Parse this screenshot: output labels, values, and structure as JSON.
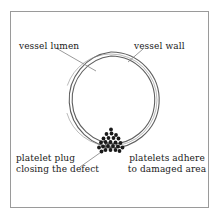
{
  "figure": {
    "type": "medical-illustration",
    "background_color": "#ffffff",
    "frame": {
      "border_color": "#9a9a9a",
      "x": 10,
      "y": 11,
      "width": 199,
      "height": 197
    },
    "vessel": {
      "shape": "circle",
      "center_x": 111,
      "center_y": 100,
      "outer_radius": 48,
      "inner_radius": 44,
      "wall_color": "#6e6e6e",
      "wall_fill": "#ffffff",
      "gap_description": "defect opening at bottom of vessel wall",
      "gap_start_degrees": 83,
      "gap_end_degrees": 97
    },
    "platelets": {
      "count": 24,
      "color": "#1a1a1a",
      "radius": 1.9,
      "cluster_center_x": 111,
      "cluster_center_y": 143,
      "points": [
        [
          106.5,
          134.0
        ],
        [
          111.5,
          133.5
        ],
        [
          116.0,
          135.0
        ],
        [
          103.5,
          138.5
        ],
        [
          108.5,
          138.0
        ],
        [
          113.5,
          138.0
        ],
        [
          118.5,
          138.5
        ],
        [
          101.0,
          142.5
        ],
        [
          105.5,
          142.0
        ],
        [
          110.5,
          142.0
        ],
        [
          115.5,
          142.5
        ],
        [
          120.5,
          143.0
        ],
        [
          103.0,
          146.5
        ],
        [
          108.0,
          146.0
        ],
        [
          113.0,
          146.0
        ],
        [
          118.0,
          146.5
        ],
        [
          99.0,
          147.5
        ],
        [
          122.5,
          147.5
        ],
        [
          105.5,
          150.0
        ],
        [
          110.5,
          150.0
        ],
        [
          115.5,
          150.0
        ],
        [
          101.5,
          151.5
        ],
        [
          119.5,
          151.0
        ],
        [
          111.0,
          129.5
        ]
      ]
    },
    "leader_lines": [
      {
        "name": "vessel-lumen-leader",
        "color": "#777777",
        "x1": 56,
        "y1": 48,
        "x2": 96,
        "y2": 71
      },
      {
        "name": "vessel-wall-leader",
        "color": "#777777",
        "x1": 143,
        "y1": 49,
        "x2": 128,
        "y2": 62
      },
      {
        "name": "platelet-plug-leader",
        "color": "#777777",
        "x1": 80,
        "y1": 167,
        "x2": 104,
        "y2": 150
      }
    ]
  },
  "labels": {
    "vessel_lumen": "vessel lumen",
    "vessel_wall": "vessel wall",
    "platelet_plug_line1": "platelet plug",
    "platelet_plug_line2": "closing the defect",
    "platelets_adhere_line1": "platelets adhere",
    "platelets_adhere_line2": "to damaged area"
  }
}
